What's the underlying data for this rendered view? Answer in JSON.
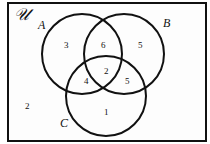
{
  "diagram": {
    "type": "venn",
    "universe_label": "𝒰",
    "sets": [
      {
        "name": "A",
        "label": "A"
      },
      {
        "name": "B",
        "label": "B"
      },
      {
        "name": "C",
        "label": "C"
      }
    ],
    "regions": {
      "A_only": "3",
      "B_only": "5",
      "C_only": "1",
      "A_and_B_only": "6",
      "A_and_C_only": "4",
      "B_and_C_only": "5",
      "A_and_B_and_C": "2",
      "outside": "2"
    },
    "colors": {
      "stroke": "#111111",
      "background": "#ffffff"
    }
  }
}
